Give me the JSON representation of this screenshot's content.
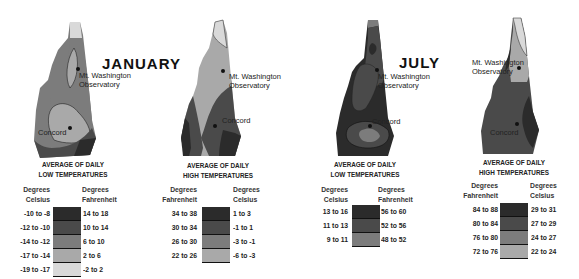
{
  "months": {
    "january": "JANUARY",
    "july": "JULY"
  },
  "places": {
    "observatory": "Mt. Washington Observatory",
    "observatory_l1": "Mt. Washington",
    "observatory_l2": "Observatory",
    "city": "Concord"
  },
  "panels": [
    {
      "title_l1": "AVERAGE OF DAILY",
      "title_l2": "LOW TEMPERATURES",
      "left_header_l1": "Degrees",
      "left_header_l2": "Celsius",
      "right_header_l1": "Degrees",
      "right_header_l2": "Fahrenheit",
      "rows": [
        {
          "left": "-10 to -8",
          "right": "14 to 18",
          "color": "#2b2b2b"
        },
        {
          "left": "-12 to -10",
          "right": "10 to 14",
          "color": "#4a4a4a"
        },
        {
          "left": "-14 to -12",
          "right": "6 to 10",
          "color": "#7c7c7c"
        },
        {
          "left": "-17 to -14",
          "right": "2 to 6",
          "color": "#a9a9a9"
        },
        {
          "left": "-19 to -17",
          "right": "-2 to 2",
          "color": "#d9d9d9"
        }
      ]
    },
    {
      "title_l1": "AVERAGE OF DAILY",
      "title_l2": "HIGH TEMPERATURES",
      "left_header_l1": "Degrees",
      "left_header_l2": "Fahrenheit",
      "right_header_l1": "Degrees",
      "right_header_l2": "Celsius",
      "rows": [
        {
          "left": "34 to 38",
          "right": "1 to 3",
          "color": "#2b2b2b"
        },
        {
          "left": "30 to 34",
          "right": "-1 to 1",
          "color": "#4a4a4a"
        },
        {
          "left": "26 to 30",
          "right": "-3 to -1",
          "color": "#7c7c7c"
        },
        {
          "left": "22 to 26",
          "right": "-6 to -3",
          "color": "#a9a9a9"
        }
      ]
    },
    {
      "title_l1": "AVERAGE OF DAILY",
      "title_l2": "LOW TEMPERATURES",
      "left_header_l1": "Degrees",
      "left_header_l2": "Celsius",
      "right_header_l1": "Degrees",
      "right_header_l2": "Fahrenheit",
      "rows": [
        {
          "left": "13 to 16",
          "right": "56 to 60",
          "color": "#2b2b2b"
        },
        {
          "left": "11 to 13",
          "right": "52 to 56",
          "color": "#4a4a4a"
        },
        {
          "left": "9 to 11",
          "right": "48 to 52",
          "color": "#7c7c7c"
        }
      ]
    },
    {
      "title_l1": "AVERAGE OF DAILY",
      "title_l2": "HIGH TEMPERATURES",
      "left_header_l1": "Degrees",
      "left_header_l2": "Fahrenheit",
      "right_header_l1": "Degrees",
      "right_header_l2": "Celsius",
      "rows": [
        {
          "left": "84 to 88",
          "right": "29 to 31",
          "color": "#2b2b2b"
        },
        {
          "left": "80 to 84",
          "right": "27 to 29",
          "color": "#4a4a4a"
        },
        {
          "left": "76 to 80",
          "right": "24 to 27",
          "color": "#7c7c7c"
        },
        {
          "left": "72 to 76",
          "right": "22 to 24",
          "color": "#a9a9a9"
        }
      ]
    }
  ]
}
